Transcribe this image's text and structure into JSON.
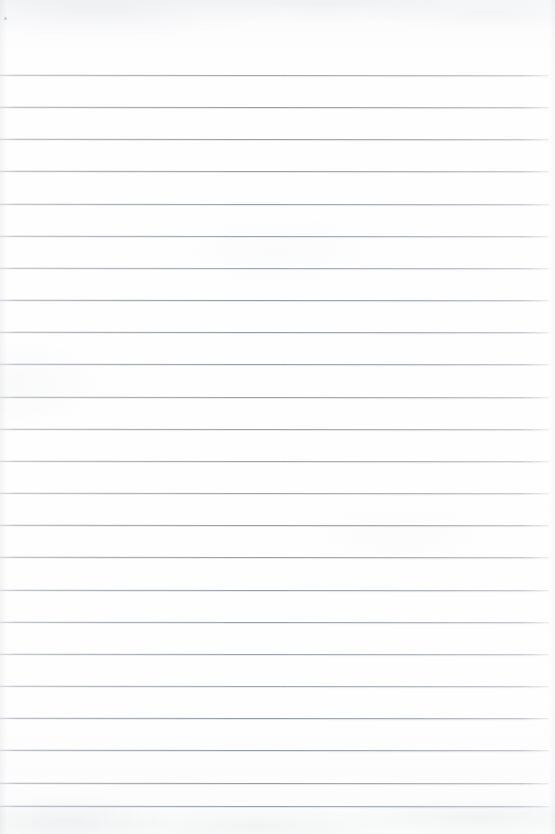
{
  "document": {
    "kind": "blank-ruled-notebook-paper-scan",
    "title": "Blank Ruled Paper",
    "text_content": "",
    "has_text": false,
    "has_handwriting": false,
    "has_margin_line": false,
    "page_width_px": 555,
    "page_height_px": 834
  },
  "colors": {
    "paper": "#fdfdfd",
    "paper_top_edge": "#f7f8f9",
    "rule": "#9aa0a7",
    "rule_faded": "#b0b5bb",
    "speck": "#969ba1"
  },
  "ruling": {
    "style": "horizontal-ruled",
    "line_count": 24,
    "first_line_y": 75,
    "spacing_px": 32.2,
    "line_thickness_px": 1,
    "line_start_x": 0,
    "line_end_x": 549,
    "right_margin_px": 6,
    "line_y_positions": [
      75,
      107,
      139,
      171,
      204,
      236,
      268,
      300,
      332,
      364,
      397,
      429,
      461,
      493,
      525,
      557,
      590,
      622,
      654,
      686,
      718,
      750,
      783,
      806
    ]
  },
  "artifacts": [
    {
      "name": "scanner-speck",
      "x": 4,
      "y": 17,
      "size": 3
    }
  ]
}
